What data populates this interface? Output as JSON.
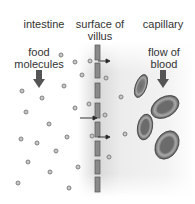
{
  "labels": {
    "intestine": "intestine",
    "surface_line1": "surface of",
    "surface_line2": "villus",
    "capillary": "capillary",
    "food_line1": "food",
    "food_line2": "molecules",
    "flow_line1": "flow of",
    "flow_line2": "blood"
  },
  "icons": [
    "down-arrow-icon",
    "molecule-icon",
    "red-blood-cell-icon",
    "right-arrow-icon"
  ]
}
